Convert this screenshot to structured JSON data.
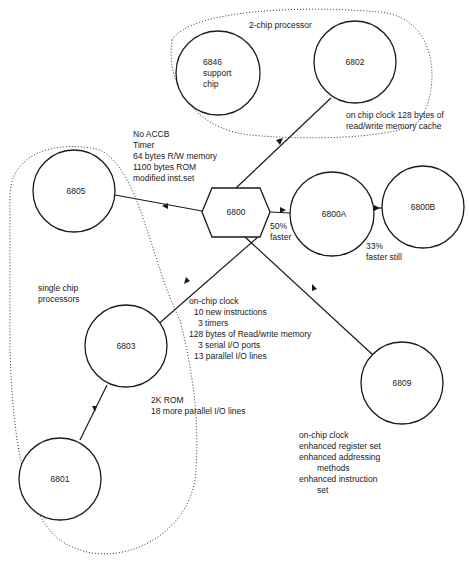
{
  "diagram": {
    "groups": {
      "two_chip": "2-chip processor",
      "single_chip": [
        "single chip",
        "processors"
      ]
    },
    "nodes": {
      "n6800": "6800",
      "n6802": "6802",
      "n6846": [
        "6846",
        "support",
        "chip"
      ],
      "n6805": "6805",
      "n6800A": "6800A",
      "n6800B": "6800B",
      "n6803": "6803",
      "n6801": "6801",
      "n6809": "6809"
    },
    "annotations": {
      "a6802": [
        "on chip clock 128 bytes of",
        "read/write memory cache"
      ],
      "a6805": [
        "No ACCB",
        "Timer",
        "64 bytes R/W memory",
        "1100 bytes ROM",
        "modified inst.set"
      ],
      "a6800A": [
        "50%",
        "faster"
      ],
      "a6800B": [
        "33%",
        "faster still"
      ],
      "a6803": [
        "on-chip clock",
        "10  new instructions",
        "3  timers",
        "128  bytes of Read/write memory",
        "3  serial I/O ports",
        "13  parallel I/O lines"
      ],
      "a6801": [
        "2K ROM",
        "18 more parallel I/O lines"
      ],
      "a6809": [
        "on-chip clock",
        "enhanced register set",
        "enhanced addressing",
        "methods",
        "enhanced instruction",
        "set"
      ]
    },
    "colors": {
      "ink": "#1a1a1a",
      "background": "#ffffff"
    }
  }
}
